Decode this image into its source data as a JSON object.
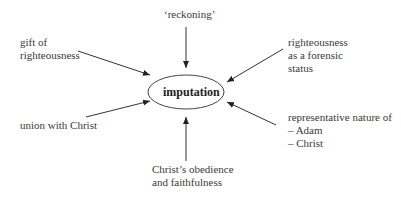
{
  "diagram": {
    "center": {
      "label": "imputation"
    },
    "nodes": [
      {
        "id": "reckoning",
        "lines": [
          "‘reckoning’"
        ]
      },
      {
        "id": "gift",
        "lines": [
          "gift of",
          "righteousness"
        ]
      },
      {
        "id": "forensic",
        "lines": [
          "righteousness",
          "as a forensic",
          "status"
        ]
      },
      {
        "id": "union",
        "lines": [
          "union with Christ"
        ]
      },
      {
        "id": "representative",
        "lines": [
          "representative nature of",
          "– Adam",
          "– Christ"
        ]
      },
      {
        "id": "obedience",
        "lines": [
          "Christ’s obedience",
          "and faithfulness"
        ]
      }
    ]
  }
}
